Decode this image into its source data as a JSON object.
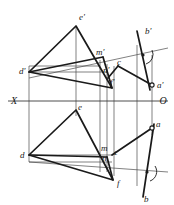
{
  "figure": {
    "width": 174,
    "height": 205,
    "background": "#ffffff",
    "line_color": "#1a1a1a",
    "thin_line_color": "#4a4a4a"
  },
  "axis": {
    "left_label": "X",
    "right_label": "O",
    "y": 101,
    "x_start": 8,
    "x_end": 168
  },
  "labels": {
    "e_prime": "e'",
    "d_prime": "d'",
    "m_prime": "m'",
    "n_prime": "n'",
    "f_prime": "f'",
    "c_prime": "c",
    "b_prime": "b'",
    "a_prime": "a'",
    "e": "e",
    "d": "d",
    "m": "m",
    "n": "n",
    "c": "c",
    "f": "f",
    "a": "a",
    "b": "b"
  },
  "points": {
    "e_prime": {
      "x": 76,
      "y": 26
    },
    "d_prime": {
      "x": 29,
      "y": 72
    },
    "m_prime": {
      "x": 103,
      "y": 57
    },
    "n_prime": {
      "x": 107,
      "y": 70
    },
    "f_prime": {
      "x": 112,
      "y": 88
    },
    "c_prime": {
      "x": 118,
      "y": 68
    },
    "b_prime": {
      "x": 143,
      "y": 38
    },
    "a_prime": {
      "x": 152,
      "y": 85
    },
    "e": {
      "x": 76,
      "y": 110
    },
    "d": {
      "x": 29,
      "y": 155
    },
    "m": {
      "x": 103,
      "y": 148
    },
    "n": {
      "x": 107,
      "y": 157
    },
    "c": {
      "x": 115,
      "y": 152
    },
    "f": {
      "x": 113,
      "y": 180
    },
    "a": {
      "x": 152,
      "y": 128
    },
    "b": {
      "x": 146,
      "y": 192
    }
  },
  "elements": {
    "upper_triangle": "d'-e'-f'",
    "lower_triangle": "d-e-f",
    "oblique_upper": "d'-m'-b'-trace",
    "oblique_lower": "d-n-b-trace",
    "right_angle_markers": 2,
    "open_circles": [
      "a'",
      "a",
      "b'",
      "b"
    ]
  }
}
